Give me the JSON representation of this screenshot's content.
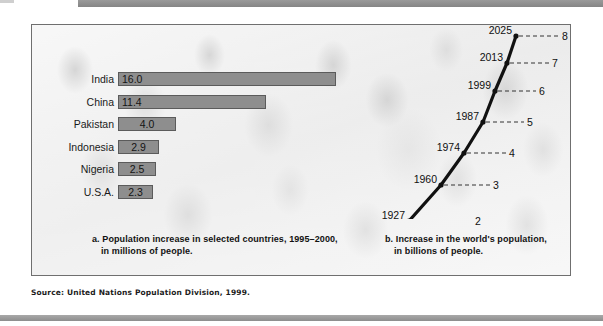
{
  "source_note": "Source: United Nations Population Division, 1999.",
  "colors": {
    "bar_fill": "#8e8e8e",
    "bar_stroke": "#5b5b5b",
    "line_stroke": "#111111",
    "panel_border": "#6f6f6f",
    "band": "#8f8f8f"
  },
  "captions": {
    "a_line1": "a. Population increase in selected countries, 1995–2000,",
    "a_line2": "in millions of people.",
    "b_line1": "b. Increase in the world's population,",
    "b_line2": "in billions of people."
  },
  "chart_data": [
    {
      "type": "bar",
      "title": "a. Population increase in selected countries, 1995–2000, in millions of people.",
      "xlabel": "",
      "ylabel": "",
      "orientation": "horizontal",
      "xlim": [
        0,
        16.0
      ],
      "grid": false,
      "legend": "none",
      "categories": [
        "India",
        "China",
        "Pakistan",
        "Indonesia",
        "Nigeria",
        "U.S.A."
      ],
      "values": [
        16.0,
        11.4,
        4.0,
        2.9,
        2.5,
        2.3
      ],
      "value_labels": [
        "16.0",
        "11.4",
        "4.0",
        "2.9",
        "2.5",
        "2.3"
      ],
      "units": "millions of people"
    },
    {
      "type": "line",
      "title": "b. Increase in the world's population, in billions of people.",
      "xlabel": "Year",
      "ylabel": "Billions of people",
      "grid": false,
      "legend": "none",
      "x": [
        1927,
        1960,
        1974,
        1987,
        1999,
        2013,
        2025
      ],
      "x_labels": [
        "1927",
        "1960",
        "1974",
        "1987",
        "1999",
        "2013",
        "2025"
      ],
      "values": [
        2,
        3,
        4,
        5,
        6,
        7,
        8
      ],
      "value_labels": [
        "2",
        "3",
        "4",
        "5",
        "6",
        "7",
        "8"
      ],
      "ylim": [
        2,
        8
      ],
      "units": "billions of people"
    }
  ],
  "bars": [
    {
      "label": "India",
      "value_label": "16.0",
      "width": 218,
      "value_pos": "left"
    },
    {
      "label": "China",
      "value_label": "11.4",
      "width": 148,
      "value_pos": "left"
    },
    {
      "label": "Pakistan",
      "value_label": "4.0",
      "width": 58,
      "value_pos": "mid"
    },
    {
      "label": "Indonesia",
      "value_label": "2.9",
      "width": 41,
      "value_pos": "mid"
    },
    {
      "label": "Nigeria",
      "value_label": "2.5",
      "width": 38,
      "value_pos": "mid"
    },
    {
      "label": "U.S.A.",
      "value_label": "2.3",
      "width": 35,
      "value_pos": "mid"
    }
  ],
  "points": [
    {
      "year": "1927",
      "value": "2"
    },
    {
      "year": "1960",
      "value": "3"
    },
    {
      "year": "1974",
      "value": "4"
    },
    {
      "year": "1987",
      "value": "5"
    },
    {
      "year": "1999",
      "value": "6"
    },
    {
      "year": "2013",
      "value": "7"
    },
    {
      "year": "2025",
      "value": "8"
    }
  ]
}
